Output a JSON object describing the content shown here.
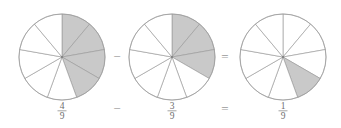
{
  "diagram": {
    "type": "fraction-subtraction",
    "equation_text": "4/9 - 3/9 = 1/9",
    "background_color": "#ffffff",
    "shaded_color": "#c9c9c9",
    "outline_color": "#9b9b9b",
    "text_color": "#6e6e6e",
    "slices_per_circle": 9,
    "circles": [
      {
        "id": "circle-minuend",
        "role": "minuend",
        "center_x": 62,
        "center_y": 57,
        "radius": 43,
        "total_slices": 9,
        "shaded_slices": 4,
        "shaded_indices": [
          0,
          1,
          2,
          3
        ],
        "fraction": {
          "numerator": "4",
          "denominator": "9",
          "label_x": 62,
          "label_y": 112
        }
      },
      {
        "id": "circle-subtrahend",
        "role": "subtrahend",
        "center_x": 172,
        "center_y": 57,
        "radius": 43,
        "total_slices": 9,
        "shaded_slices": 3,
        "shaded_indices": [
          0,
          1,
          2
        ],
        "fraction": {
          "numerator": "3",
          "denominator": "9",
          "label_x": 172,
          "label_y": 112
        }
      },
      {
        "id": "circle-difference",
        "role": "difference",
        "center_x": 283,
        "center_y": 57,
        "radius": 43,
        "total_slices": 9,
        "shaded_slices": 1,
        "shaded_indices": [
          3
        ],
        "fraction": {
          "numerator": "1",
          "denominator": "9",
          "label_x": 283,
          "label_y": 112
        }
      }
    ],
    "operators": [
      {
        "id": "minus-between-circles",
        "symbol": "−",
        "x": 117,
        "y": 61
      },
      {
        "id": "equals-between-circles",
        "symbol": "=",
        "x": 225,
        "y": 61
      },
      {
        "id": "minus-between-fractions",
        "symbol": "−",
        "x": 117,
        "y": 113
      },
      {
        "id": "equals-between-fractions",
        "symbol": "=",
        "x": 225,
        "y": 113
      }
    ]
  }
}
